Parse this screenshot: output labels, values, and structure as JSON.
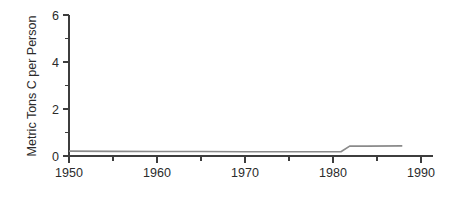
{
  "chart_data": {
    "type": "line",
    "title": "",
    "subtitle": "",
    "xlabel": "",
    "ylabel": "Metric Tons C per Person",
    "xlim": [
      1950,
      1991.5
    ],
    "ylim": [
      0,
      6.3
    ],
    "grid": false,
    "legend": null,
    "legend_position": "none",
    "background_color": "#ffffff",
    "line_color": "#8a8a8a",
    "axis_color": "#3d3d3d",
    "x_ticks_major": [
      1950,
      1960,
      1970,
      1980,
      1990
    ],
    "x_tick_labels": [
      "1950",
      "1960",
      "1970",
      "1980",
      "1990"
    ],
    "x_ticks_minor": [
      1955,
      1965,
      1975,
      1985
    ],
    "y_ticks_major": [
      0,
      2,
      4,
      6
    ],
    "y_tick_labels": [
      "0",
      "2",
      "4",
      "6"
    ],
    "y_ticks_minor": [
      1,
      3,
      5
    ],
    "series": [
      {
        "name": "Emissions per capita",
        "x": [
          1950,
          1955,
          1960,
          1965,
          1970,
          1975,
          1979,
          1981,
          1982,
          1984,
          1988
        ],
        "values": [
          0.22,
          0.21,
          0.2,
          0.2,
          0.19,
          0.19,
          0.19,
          0.19,
          0.44,
          0.44,
          0.45
        ]
      }
    ]
  },
  "annotations": {
    "notes": []
  }
}
